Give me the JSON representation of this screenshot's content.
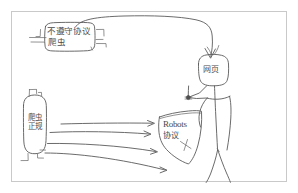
{
  "diagram": {
    "background_color": "#ffffff",
    "ink_color": "#5a5a5a",
    "frame_color": "#c9c9c9",
    "nodes": {
      "noncompliant_crawler": {
        "line1": "不遵守协议",
        "line2": "爬虫",
        "shape": "rounded-rect"
      },
      "webpage": {
        "label": "网页",
        "shape": "rounded-rect"
      },
      "legit_crawler": {
        "label": "爬虫正规",
        "shape": "oval"
      },
      "robots_shield": {
        "line1": "Robots",
        "line2": "协议",
        "shape": "shield"
      },
      "person": {
        "label": "stick-figure",
        "shape": "stick-figure"
      }
    },
    "edges": [
      {
        "from": "noncompliant_crawler",
        "to": "webpage",
        "style": "curved-arrow"
      },
      {
        "from": "legit_crawler",
        "to": "robots_shield",
        "style": "arrow"
      },
      {
        "from": "legit_crawler",
        "to": "robots_shield",
        "style": "arrow"
      },
      {
        "from": "legit_crawler",
        "to": "robots_shield",
        "style": "arrow"
      },
      {
        "from": "legit_crawler",
        "to": "robots_shield",
        "style": "arrow"
      },
      {
        "from": "webpage",
        "to": "robots_shield",
        "style": "line-with-dot"
      }
    ]
  }
}
